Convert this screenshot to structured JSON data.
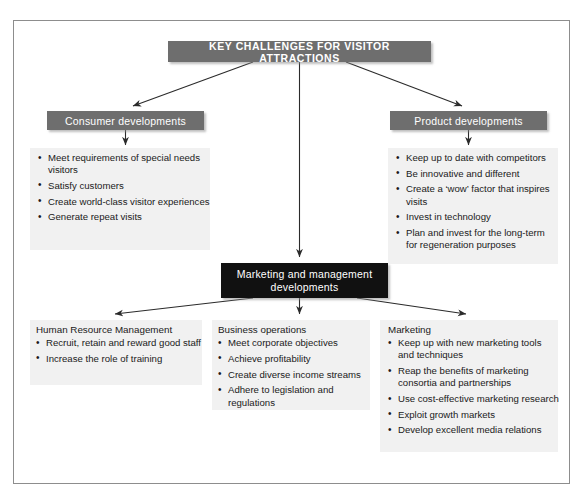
{
  "figure": {
    "title": "KEY CHALLENGES FOR VISITOR ATTRACTIONS"
  },
  "branches": {
    "consumer": {
      "label": "Consumer developments",
      "bullets": [
        "Meet requirements of special needs visitors",
        "Satisfy customers",
        "Create world-class visitor experiences",
        "Generate repeat visits"
      ]
    },
    "product": {
      "label": "Product developments",
      "bullets": [
        "Keep up to date with competitors",
        "Be innovative and different",
        "Create a ‘wow’ factor that inspires visits",
        "Invest in technology",
        "Plan and invest for the long-term for regeneration purposes"
      ]
    }
  },
  "center": {
    "line1": "Marketing and management",
    "line2": "developments"
  },
  "columns": {
    "hr": {
      "heading": "Human Resource Management",
      "bullets": [
        "Recruit, retain and reward good staff",
        "Increase the role of training"
      ]
    },
    "business": {
      "heading": "Business operations",
      "bullets": [
        "Meet corporate objectives",
        "Achieve profitability",
        "Create diverse income streams",
        "Adhere to legislation and regulations"
      ]
    },
    "marketing": {
      "heading": "Marketing",
      "bullets": [
        "Keep up with new marketing tools and techniques",
        "Reap the benefits of marketing consortia and partnerships",
        "Use cost-effective marketing research",
        "Exploit growth markets",
        "Develop excellent media relations"
      ]
    }
  },
  "colors": {
    "header_bar": "#6e6e6e",
    "center_bar": "#111111",
    "panel": "#f1f1f1",
    "frame_border": "#8d8d8d",
    "connector": "#2b2b2b"
  }
}
